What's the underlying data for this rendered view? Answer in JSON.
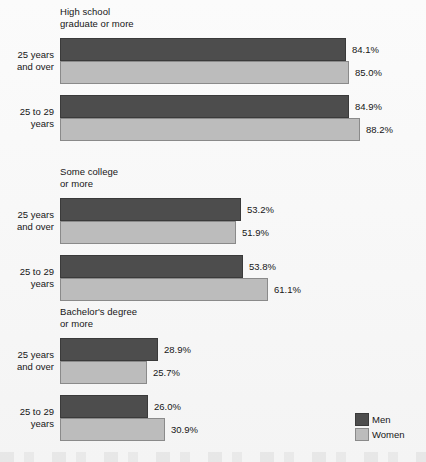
{
  "chart_data": {
    "type": "bar",
    "orientation": "horizontal",
    "title": "",
    "xlabel": "",
    "ylabel": "",
    "xlim": [
      0,
      100
    ],
    "grid": false,
    "legend_position": "bottom-right",
    "value_suffix": "%",
    "categories": [
      "25 years and over",
      "25 to 29 years"
    ],
    "series": [
      {
        "name": "Men",
        "color": "#4d4d4d"
      },
      {
        "name": "Women",
        "color": "#bcbcbc"
      }
    ],
    "groups": [
      {
        "title": "High school\ngraduate or more",
        "rows": [
          {
            "category": "25 years\nand over",
            "bars": [
              {
                "series": "Men",
                "value": 84.1,
                "label": "84.1%"
              },
              {
                "series": "Women",
                "value": 85.0,
                "label": "85.0%"
              }
            ]
          },
          {
            "category": "25 to 29\nyears",
            "bars": [
              {
                "series": "Men",
                "value": 84.9,
                "label": "84.9%"
              },
              {
                "series": "Women",
                "value": 88.2,
                "label": "88.2%"
              }
            ]
          }
        ]
      },
      {
        "title": "Some college\nor more",
        "rows": [
          {
            "category": "25 years\nand over",
            "bars": [
              {
                "series": "Men",
                "value": 53.2,
                "label": "53.2%"
              },
              {
                "series": "Women",
                "value": 51.9,
                "label": "51.9%"
              }
            ]
          },
          {
            "category": "25 to 29\nyears",
            "bars": [
              {
                "series": "Men",
                "value": 53.8,
                "label": "53.8%"
              },
              {
                "series": "Women",
                "value": 61.1,
                "label": "61.1%"
              }
            ]
          }
        ]
      },
      {
        "title": "Bachelor's degree\nor more",
        "rows": [
          {
            "category": "25 years\nand over",
            "bars": [
              {
                "series": "Men",
                "value": 28.9,
                "label": "28.9%"
              },
              {
                "series": "Women",
                "value": 25.7,
                "label": "25.7%"
              }
            ]
          },
          {
            "category": "25 to 29\nyears",
            "bars": [
              {
                "series": "Men",
                "value": 26.0,
                "label": "26.0%"
              },
              {
                "series": "Women",
                "value": 30.9,
                "label": "30.9%"
              }
            ]
          }
        ]
      }
    ]
  },
  "legend": {
    "items": [
      {
        "label": "Men",
        "swatch": "men-swatch",
        "color": "#4d4d4d"
      },
      {
        "label": "Women",
        "swatch": "women-swatch",
        "color": "#bcbcbc"
      }
    ]
  },
  "layout": {
    "bar_origin_x": 60,
    "px_per_percent": 3.4,
    "bar_height": 23,
    "group_tops": [
      6,
      166,
      306
    ],
    "row_offsets": [
      32,
      89
    ]
  }
}
